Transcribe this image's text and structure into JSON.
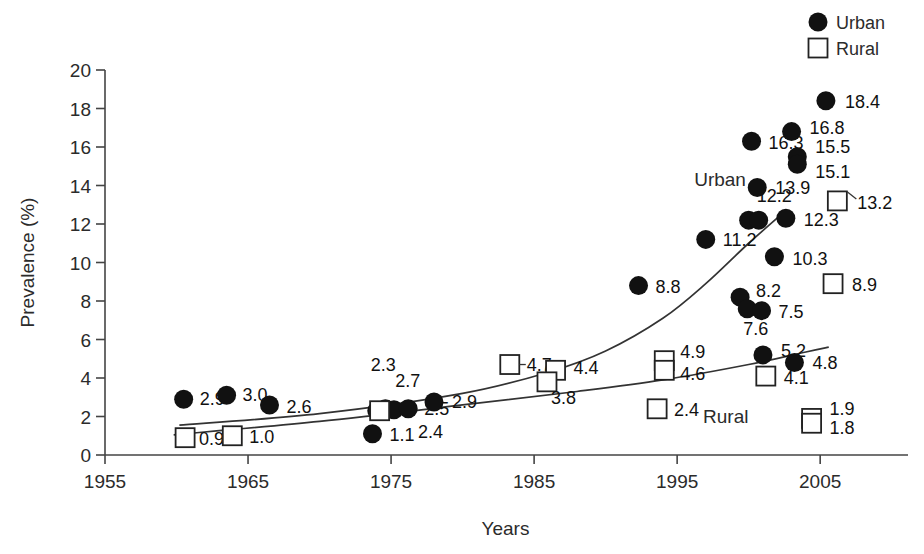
{
  "chart_data": {
    "type": "scatter",
    "title": "",
    "xlabel": "Years",
    "ylabel": "Prevalence (%)",
    "xlim": [
      1955,
      2011
    ],
    "ylim": [
      0,
      20
    ],
    "grid": false,
    "legend_position": "top-right",
    "xticks": [
      "1955",
      "1965",
      "1975",
      "1985",
      "1995",
      "2005"
    ],
    "xtick_values": [
      1955,
      1965,
      1975,
      1985,
      1995,
      2005
    ],
    "yticks": [
      "0",
      "2",
      "4",
      "6",
      "8",
      "10",
      "12",
      "14",
      "16",
      "18",
      "20"
    ],
    "ytick_values": [
      0,
      2,
      4,
      6,
      8,
      10,
      12,
      14,
      16,
      18,
      20
    ],
    "series": [
      {
        "name": "Urban",
        "marker": "filled-circle",
        "color": "#111111",
        "points": [
          {
            "x": 1960.5,
            "y": 2.9,
            "label": "2.9",
            "lx": 16,
            "ly": 6
          },
          {
            "x": 1963.5,
            "y": 3.1,
            "label": "3.0",
            "lx": 16,
            "ly": 6
          },
          {
            "x": 1966.5,
            "y": 2.6,
            "label": "2.6",
            "lx": 17,
            "ly": 8
          },
          {
            "x": 1973.7,
            "y": 1.1,
            "label": "1.1",
            "lx": 17,
            "ly": 7
          },
          {
            "x": 1974.0,
            "y": 2.3,
            "label": "2.3",
            "lx": -6,
            "ly": -40
          },
          {
            "x": 1974.6,
            "y": 2.4,
            "label": "2.7",
            "lx": 10,
            "ly": -22
          },
          {
            "x": 1975.2,
            "y": 2.35,
            "label": "2.4",
            "lx": 24,
            "ly": 28
          },
          {
            "x": 1976.2,
            "y": 2.4,
            "label": "2.5",
            "lx": 16,
            "ly": 6
          },
          {
            "x": 1978.0,
            "y": 2.75,
            "label": "2.9",
            "lx": 18,
            "ly": 6
          },
          {
            "x": 1992.3,
            "y": 8.8,
            "label": "8.8",
            "lx": 17,
            "ly": 7
          },
          {
            "x": 1997.0,
            "y": 11.2,
            "label": "11.2",
            "lx": 17,
            "ly": 7
          },
          {
            "x": 1999.4,
            "y": 8.2,
            "label": "8.2",
            "lx": 16,
            "ly": 0
          },
          {
            "x": 1999.9,
            "y": 7.6,
            "label": "7.6",
            "lx": -4,
            "ly": 26
          },
          {
            "x": 2000.9,
            "y": 7.5,
            "label": "7.5",
            "lx": 17,
            "ly": 7
          },
          {
            "x": 2000.2,
            "y": 16.3,
            "label": "16.3",
            "lx": 17,
            "ly": 8
          },
          {
            "x": 2000.0,
            "y": 12.2,
            "label": "12.2",
            "lx": 8,
            "ly": -18
          },
          {
            "x": 2000.7,
            "y": 12.2,
            "label": "",
            "lx": 0,
            "ly": 0
          },
          {
            "x": 2000.6,
            "y": 13.9,
            "label": "13.9",
            "lx": 18,
            "ly": 7
          },
          {
            "x": 2001.0,
            "y": 5.2,
            "label": "5.2",
            "lx": 18,
            "ly": 2
          },
          {
            "x": 2001.8,
            "y": 10.3,
            "label": "10.3",
            "lx": 18,
            "ly": 8
          },
          {
            "x": 2002.6,
            "y": 12.3,
            "label": "12.3",
            "lx": 18,
            "ly": 8
          },
          {
            "x": 2003.2,
            "y": 4.8,
            "label": "4.8",
            "lx": 18,
            "ly": 6
          },
          {
            "x": 2003.0,
            "y": 16.8,
            "label": "16.8",
            "lx": 18,
            "ly": 2
          },
          {
            "x": 2003.4,
            "y": 15.5,
            "label": "15.5",
            "lx": 18,
            "ly": -4
          },
          {
            "x": 2003.4,
            "y": 15.1,
            "label": "15.1",
            "lx": 18,
            "ly": 14
          },
          {
            "x": 2005.4,
            "y": 18.4,
            "label": "18.4",
            "lx": 19,
            "ly": 7
          }
        ]
      },
      {
        "name": "Rural",
        "marker": "open-square",
        "color": "#ffffff",
        "points": [
          {
            "x": 1960.6,
            "y": 0.9,
            "label": "0.9",
            "lx": 14,
            "ly": 7
          },
          {
            "x": 1963.9,
            "y": 1.0,
            "label": "1.0",
            "lx": 17,
            "ly": 7
          },
          {
            "x": 1974.2,
            "y": 2.3,
            "label": "",
            "lx": 0,
            "ly": 0
          },
          {
            "x": 1983.3,
            "y": 4.7,
            "label": "4.7",
            "lx": 17,
            "ly": 6
          },
          {
            "x": 1986.5,
            "y": 4.4,
            "label": "4.4",
            "lx": 18,
            "ly": 4
          },
          {
            "x": 1985.9,
            "y": 3.8,
            "label": "3.8",
            "lx": 4,
            "ly": 22
          },
          {
            "x": 1994.1,
            "y": 4.9,
            "label": "4.9",
            "lx": 16,
            "ly": -3
          },
          {
            "x": 1994.1,
            "y": 4.4,
            "label": "4.6",
            "lx": 16,
            "ly": 10
          },
          {
            "x": 1993.6,
            "y": 2.4,
            "label": "2.4",
            "lx": 17,
            "ly": 7
          },
          {
            "x": 2001.2,
            "y": 4.1,
            "label": "4.1",
            "lx": 18,
            "ly": 8
          },
          {
            "x": 2004.4,
            "y": 1.9,
            "label": "1.9",
            "lx": 18,
            "ly": -3
          },
          {
            "x": 2004.4,
            "y": 1.65,
            "label": "1.8",
            "lx": 18,
            "ly": 11
          },
          {
            "x": 2005.9,
            "y": 8.9,
            "label": "8.9",
            "lx": 19,
            "ly": 7
          },
          {
            "x": 2006.2,
            "y": 13.2,
            "label": "13.2",
            "lx": 20,
            "ly": 8
          }
        ]
      }
    ],
    "trend_lines": [
      {
        "name": "urban-trend",
        "points": [
          [
            1960.2,
            1.55
          ],
          [
            1970,
            2.15
          ],
          [
            1980,
            3.2
          ],
          [
            1986,
            4.3
          ],
          [
            1990,
            5.4
          ],
          [
            1994,
            7.1
          ],
          [
            1997,
            8.9
          ],
          [
            2000,
            11.0
          ],
          [
            2002.6,
            12.7
          ]
        ]
      },
      {
        "name": "rural-trend",
        "points": [
          [
            1959.8,
            1.05
          ],
          [
            1970,
            1.75
          ],
          [
            1980,
            2.6
          ],
          [
            1988,
            3.3
          ],
          [
            1994,
            3.9
          ],
          [
            2000,
            4.7
          ],
          [
            2004,
            5.35
          ],
          [
            2005.6,
            5.6
          ]
        ]
      }
    ],
    "annotations": [
      {
        "name": "urban-inline-label",
        "text": "Urban",
        "x": 1998.0,
        "y": 14.0
      },
      {
        "name": "rural-inline-label",
        "text": "Rural",
        "x": 1998.4,
        "y": 1.65
      }
    ],
    "legend": [
      {
        "label": "Urban",
        "marker": "filled-circle"
      },
      {
        "label": "Rural",
        "marker": "open-square"
      }
    ]
  }
}
